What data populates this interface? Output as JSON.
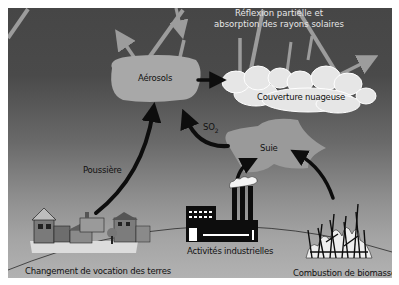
{
  "diagram": {
    "title": "Réflexion partielle et absorption des rayons solaires",
    "title_lines": [
      "Réflexion partielle et",
      "absorption des rayons solaires"
    ],
    "nodes": {
      "aerosols": "Aérosols",
      "clouds": "Couverture nuageuse",
      "soot": "Suie"
    },
    "edge_labels": {
      "dust": "Poussière",
      "so2_main": "SO",
      "so2_sub": "2"
    },
    "sources": {
      "land_use": "Changement de vocation des terres",
      "industry": "Activités industrielles",
      "biomass": "Combustion de biomasse"
    },
    "edges": [
      {
        "from": "Changement de vocation des terres",
        "to": "Aérosols",
        "label": "Poussière"
      },
      {
        "from": "Suie",
        "to": "Aérosols",
        "label": "SO2"
      },
      {
        "from": "Activités industrielles",
        "to": "Suie",
        "label": ""
      },
      {
        "from": "Combustion de biomasse",
        "to": "Suie",
        "label": ""
      },
      {
        "from": "Aérosols",
        "to": "Couverture nuageuse",
        "label": ""
      }
    ],
    "colors": {
      "sky_top": "#464646",
      "sky_bottom": "#b2b2b2",
      "aerosol_fill": "#a8a8a8",
      "cloud_fill": "#e4e4e4",
      "ray_color": "#9a9a9a",
      "arrow_color": "#0d0d0d"
    }
  }
}
